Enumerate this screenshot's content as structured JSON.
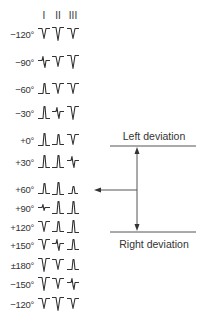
{
  "leads": [
    "I",
    "II",
    "III"
  ],
  "lead_x": [
    44,
    58,
    73
  ],
  "rows": [
    {
      "angle": "−120°",
      "y": 34,
      "waves": [
        "neg",
        "negdeep",
        "neg"
      ]
    },
    {
      "angle": "−90°",
      "y": 62,
      "waves": [
        "biph",
        "neg",
        "negdeep"
      ]
    },
    {
      "angle": "−60°",
      "y": 89,
      "waves": [
        "pos",
        "neg",
        "neg"
      ]
    },
    {
      "angle": "−30°",
      "y": 113,
      "waves": [
        "postall",
        "biph",
        "negdeep"
      ]
    },
    {
      "angle": "+0°",
      "y": 140,
      "waves": [
        "postall",
        "pos",
        "neg"
      ]
    },
    {
      "angle": "+30°",
      "y": 162,
      "waves": [
        "postall",
        "postall",
        "biph"
      ]
    },
    {
      "angle": "+60°",
      "y": 189,
      "waves": [
        "pos",
        "postall",
        "possmall"
      ]
    },
    {
      "angle": "+90°",
      "y": 208,
      "waves": [
        "biphsmall",
        "postall",
        "postall"
      ]
    },
    {
      "angle": "+120°",
      "y": 227,
      "waves": [
        "neg",
        "pos",
        "postall"
      ]
    },
    {
      "angle": "+150°",
      "y": 245,
      "waves": [
        "neg",
        "biph",
        "pos"
      ]
    },
    {
      "angle": "±180°",
      "y": 265,
      "waves": [
        "negdeep",
        "neg",
        "pos"
      ]
    },
    {
      "angle": "−150°",
      "y": 284,
      "waves": [
        "negdeep",
        "neg",
        "biph"
      ]
    },
    {
      "angle": "−120°",
      "y": 304,
      "waves": [
        "neg",
        "negdeep",
        "neg"
      ]
    }
  ],
  "annotations": {
    "left_deviation": "Left deviation",
    "right_deviation": "Right deviation"
  },
  "colors": {
    "line": "#333333",
    "arrow": "#555555"
  }
}
